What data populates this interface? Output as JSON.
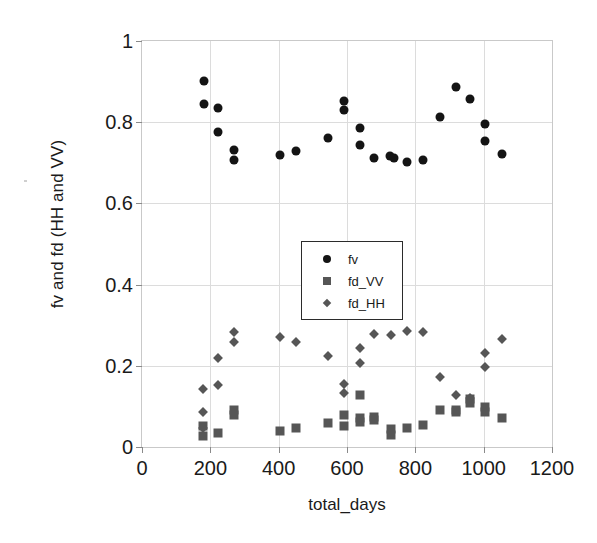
{
  "chart_data": {
    "type": "scatter",
    "title": "",
    "xlabel": "total_days",
    "ylabel": "fv and fd (HH and VV)",
    "xlim": [
      0,
      1200
    ],
    "ylim": [
      0,
      1
    ],
    "xticks": [
      "0",
      "200",
      "400",
      "600",
      "800",
      "1000",
      "1200"
    ],
    "xtick_values": [
      0,
      200,
      400,
      600,
      800,
      1000,
      1200
    ],
    "yticks": [
      "0",
      "0.2",
      "0.4",
      "0.6",
      "0.8",
      "1"
    ],
    "ytick_values": [
      0,
      0.2,
      0.4,
      0.6,
      0.8,
      1
    ],
    "grid": true,
    "legend_position": "center-left",
    "series": [
      {
        "name": "fv",
        "marker": "circle",
        "color": "#141414",
        "points": [
          [
            180,
            0.902
          ],
          [
            180,
            0.845
          ],
          [
            222,
            0.835
          ],
          [
            222,
            0.775
          ],
          [
            268,
            0.732
          ],
          [
            268,
            0.706
          ],
          [
            405,
            0.718
          ],
          [
            452,
            0.73
          ],
          [
            545,
            0.762
          ],
          [
            590,
            0.852
          ],
          [
            590,
            0.83
          ],
          [
            637,
            0.786
          ],
          [
            637,
            0.744
          ],
          [
            680,
            0.712
          ],
          [
            725,
            0.717
          ],
          [
            737,
            0.713
          ],
          [
            775,
            0.702
          ],
          [
            822,
            0.707
          ],
          [
            872,
            0.814
          ],
          [
            920,
            0.886
          ],
          [
            960,
            0.858
          ],
          [
            1003,
            0.795
          ],
          [
            1003,
            0.754
          ],
          [
            1055,
            0.722
          ]
        ]
      },
      {
        "name": "fd_VV",
        "marker": "square",
        "color": "#565656",
        "points": [
          [
            178,
            0.052
          ],
          [
            178,
            0.028
          ],
          [
            222,
            0.034
          ],
          [
            268,
            0.09
          ],
          [
            268,
            0.078
          ],
          [
            405,
            0.04
          ],
          [
            452,
            0.046
          ],
          [
            545,
            0.058
          ],
          [
            590,
            0.078
          ],
          [
            590,
            0.052
          ],
          [
            637,
            0.128
          ],
          [
            637,
            0.072
          ],
          [
            637,
            0.062
          ],
          [
            680,
            0.074
          ],
          [
            680,
            0.066
          ],
          [
            730,
            0.044
          ],
          [
            730,
            0.03
          ],
          [
            775,
            0.046
          ],
          [
            822,
            0.054
          ],
          [
            872,
            0.09
          ],
          [
            920,
            0.092
          ],
          [
            920,
            0.086
          ],
          [
            960,
            0.118
          ],
          [
            960,
            0.108
          ],
          [
            1003,
            0.098
          ],
          [
            1003,
            0.086
          ],
          [
            1055,
            0.072
          ]
        ]
      },
      {
        "name": "fd_HH",
        "marker": "diamond",
        "color": "#565656",
        "points": [
          [
            178,
            0.144
          ],
          [
            178,
            0.086
          ],
          [
            178,
            0.046
          ],
          [
            222,
            0.152
          ],
          [
            222,
            0.218
          ],
          [
            268,
            0.283
          ],
          [
            268,
            0.258
          ],
          [
            405,
            0.27
          ],
          [
            452,
            0.258
          ],
          [
            545,
            0.224
          ],
          [
            590,
            0.156
          ],
          [
            590,
            0.134
          ],
          [
            637,
            0.244
          ],
          [
            637,
            0.206
          ],
          [
            680,
            0.278
          ],
          [
            730,
            0.277
          ],
          [
            775,
            0.285
          ],
          [
            822,
            0.283
          ],
          [
            872,
            0.173
          ],
          [
            920,
            0.128
          ],
          [
            960,
            0.12
          ],
          [
            1003,
            0.231
          ],
          [
            1003,
            0.196
          ],
          [
            1055,
            0.265
          ]
        ]
      }
    ]
  },
  "legend": {
    "items": [
      {
        "label": "fv",
        "marker": "circle"
      },
      {
        "label": "fd_VV",
        "marker": "square"
      },
      {
        "label": "fd_HH",
        "marker": "diamond"
      }
    ]
  }
}
